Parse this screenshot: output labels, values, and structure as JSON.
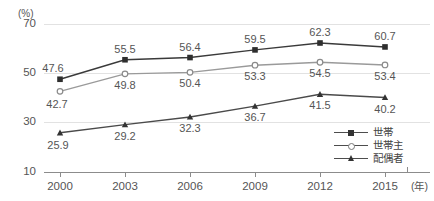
{
  "chart_data": {
    "type": "line",
    "title": "",
    "xlabel": "年",
    "ylabel": "%",
    "x_unit_label": "(年)",
    "y_unit_label": "(%)",
    "categories": [
      "2000",
      "2003",
      "2006",
      "2009",
      "2012",
      "2015"
    ],
    "ylim": [
      10,
      70
    ],
    "yticks": [
      10,
      30,
      50,
      70
    ],
    "grid": true,
    "legend_position": "bottom-right",
    "series": [
      {
        "name": "世帯",
        "marker": "filled-square",
        "values": [
          47.6,
          55.5,
          56.4,
          59.5,
          62.3,
          60.7
        ],
        "labels": [
          "47.6",
          "55.5",
          "56.4",
          "59.5",
          "62.3",
          "60.7"
        ]
      },
      {
        "name": "世帯主",
        "marker": "open-circle",
        "values": [
          42.7,
          49.8,
          50.4,
          53.3,
          54.5,
          53.4
        ],
        "labels": [
          "42.7",
          "49.8",
          "50.4",
          "53.3",
          "54.5",
          "53.4"
        ]
      },
      {
        "name": "配偶者",
        "marker": "filled-triangle",
        "values": [
          25.9,
          29.2,
          32.3,
          36.7,
          41.5,
          40.2
        ],
        "labels": [
          "25.9",
          "29.2",
          "32.3",
          "36.7",
          "41.5",
          "40.2"
        ]
      }
    ]
  },
  "axis": {
    "ytick_labels": [
      "70",
      "50",
      "30",
      "10"
    ],
    "xtick_labels": [
      "2000",
      "2003",
      "2006",
      "2009",
      "2012",
      "2015"
    ]
  },
  "legend": {
    "items": [
      {
        "label": "世帯"
      },
      {
        "label": "世帯主"
      },
      {
        "label": "配偶者"
      }
    ]
  },
  "colors": {
    "series_1": "#3a3a3a",
    "series_2": "#8a8a8a",
    "series_3": "#4a4a4a",
    "grid": "#e2e2e2",
    "axis": "#8c8c8c",
    "text": "#555555"
  }
}
